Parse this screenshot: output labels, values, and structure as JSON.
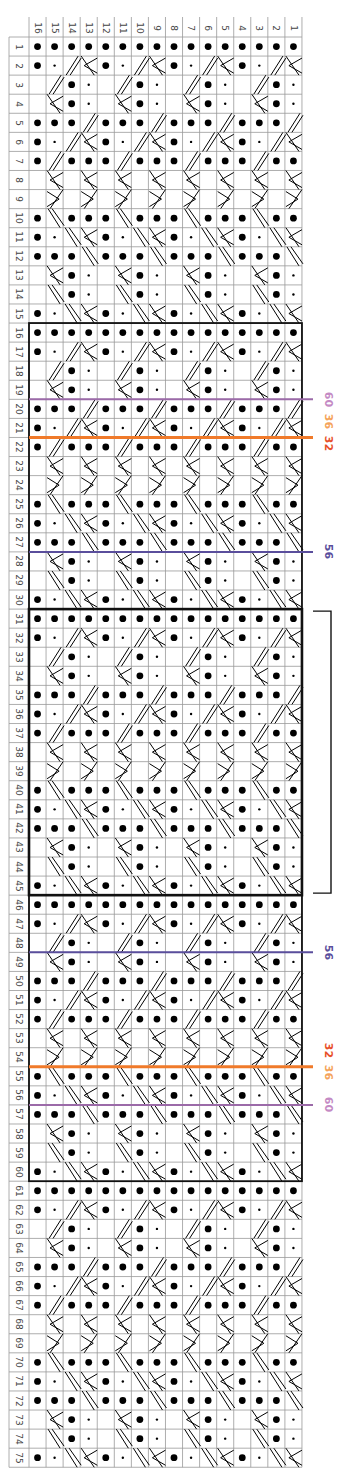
{
  "chart": {
    "title": "",
    "type": "knitting-chart",
    "columns": [
      "16",
      "15",
      "14",
      "13",
      "12",
      "11",
      "10",
      "9",
      "8",
      "7",
      "6",
      "5",
      "4",
      "3",
      "2",
      "1"
    ],
    "row_count": 75,
    "legend_codes": {
      "B": "purl (large dot)",
      "s": "small dot",
      ".": "knit (empty)",
      "/": "right-leaning cable stroke",
      "\\": "left-leaning cable stroke",
      "k": "cable chevron",
      "x": "cable cross"
    },
    "repeat_rows": [
      "BBBBBBBBBBBBBBBB",
      "Bs/kBs/kBs/kBs/k",
      "./Bs./Bs./Bs./Bs",
      ".kBs.kBs.kBs.kBs",
      "BBB/BBB/BBB/BBB/",
      "Bs/kBs/kBs/kBs/k",
      "B/BBB/BBB/BBB/BB",
      ".k.k.k.k.k.k.k.k",
      ".x.x.x.x.x.x.x.x",
      "B\\BBB\\BBB\\BBB\\BB",
      "Bs\\kBs\\kBs\\kBs\\k",
      "BBB\\BBB\\BBB\\BBB\\",
      ".kBs.kBs.kBs.kBs",
      ".\\Bs.\\Bs.\\Bs.\\Bs",
      "Bs\\kBs\\kBs\\kBs\\k"
    ],
    "repeat_length": 15,
    "boxes": [
      {
        "name": "box-rows-16-30",
        "from_row": 16,
        "to_row": 30
      },
      {
        "name": "box-rows-31-45",
        "from_row": 31,
        "to_row": 45,
        "heavy": true
      },
      {
        "name": "box-rows-46-60",
        "from_row": 46,
        "to_row": 60
      }
    ],
    "bracket": {
      "from_row": 31,
      "to_row": 45
    },
    "marker_lines": [
      {
        "after_row": 19,
        "color": "#9b6aa8",
        "label": "60",
        "label_color": "#c48ac4",
        "width": 2
      },
      {
        "after_row": 21,
        "color": "#f07a2a",
        "label": "36 32",
        "labels": [
          {
            "text": "36",
            "color": "#f5a35a"
          },
          {
            "text": "32",
            "color": "#e8502a"
          }
        ],
        "width": 3
      },
      {
        "after_row": 27,
        "color": "#5a4e9c",
        "label": "56",
        "label_color": "#5a4e9c",
        "width": 2
      },
      {
        "after_row": 48,
        "color": "#5a4e9c",
        "label": "56",
        "label_color": "#5a4e9c",
        "width": 2
      },
      {
        "after_row": 54,
        "color": "#f07a2a",
        "label": "32 36",
        "labels": [
          {
            "text": "32",
            "color": "#e8502a"
          },
          {
            "text": "36",
            "color": "#f5a35a"
          }
        ],
        "width": 3
      },
      {
        "after_row": 56,
        "color": "#9b6aa8",
        "label": "60",
        "label_color": "#c48ac4",
        "width": 2
      }
    ]
  }
}
